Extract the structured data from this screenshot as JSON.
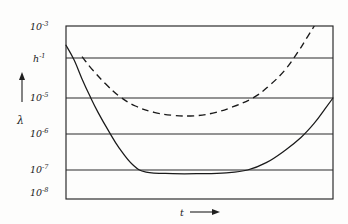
{
  "figure": {
    "kind": "scientific-line-chart",
    "background_color": "#fdfdfc",
    "ink_color": "#1a1a1a"
  },
  "axes": {
    "y_axis_symbol": "λ",
    "y_axis_arrow": "up-arrow",
    "x_axis_symbol": "t",
    "x_axis_arrow": "right-arrow",
    "y_tick_labels": [
      {
        "mantissa": "10",
        "exponent": "-3"
      },
      {
        "mantissa": "h",
        "exponent": "-1"
      },
      {
        "mantissa": "10",
        "exponent": "-5"
      },
      {
        "mantissa": "10",
        "exponent": "-6"
      },
      {
        "mantissa": "10",
        "exponent": "-7"
      },
      {
        "mantissa": "10",
        "exponent": "-8"
      }
    ]
  },
  "chart_data": {
    "type": "line",
    "title": "",
    "xlabel": "t",
    "ylabel": "λ",
    "yscale": "log",
    "xscale": "linear",
    "grid": true,
    "legend": "none",
    "ytick_values": [
      "10^-3",
      "h^-1",
      "10^-5",
      "10^-6",
      "10^-7",
      "10^-8"
    ],
    "ylim": [
      "10^-8",
      "10^-3"
    ],
    "xlim": [
      0,
      1
    ],
    "xtick_values": [],
    "series": [
      {
        "name": "solid-curve",
        "style": "solid",
        "x": [
          0.0,
          0.03,
          0.06,
          0.09,
          0.12,
          0.16,
          0.2,
          0.25,
          0.3,
          0.4,
          0.5,
          0.6,
          0.68,
          0.75,
          0.82,
          0.88,
          0.93,
          0.97,
          1.0
        ],
        "y": [
          "2.5e-4",
          "9e-5",
          "3e-5",
          "1.1e-5",
          "4e-6",
          "1.2e-6",
          "4e-7",
          "1.4e-7",
          "8.5e-8",
          "7.5e-8",
          "7.5e-8",
          "8e-8",
          "1.0e-7",
          "1.6e-7",
          "3.5e-7",
          "8e-7",
          "2e-6",
          "5e-6",
          "1.0e-5"
        ]
      },
      {
        "name": "dashed-curve",
        "style": "dashed",
        "x": [
          0.06,
          0.1,
          0.15,
          0.2,
          0.26,
          0.33,
          0.4,
          0.48,
          0.55,
          0.62,
          0.7,
          0.76,
          0.82,
          0.87,
          0.9,
          0.93
        ],
        "y": [
          "1.1e-4",
          "5e-5",
          "2.2e-5",
          "1.1e-5",
          "6e-6",
          "4e-6",
          "3.3e-6",
          "3.2e-6",
          "3.8e-6",
          "5.5e-6",
          "1.0e-5",
          "2.0e-5",
          "5e-5",
          "1.6e-4",
          "4e-4",
          "1.0e-3"
        ]
      }
    ],
    "gridline_levels": [
      "10^-3",
      "h^-1",
      "10^-5",
      "10^-6",
      "10^-7",
      "10^-8"
    ]
  }
}
